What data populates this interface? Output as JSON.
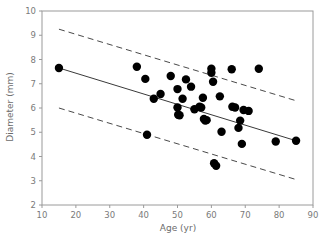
{
  "chart_data": {
    "type": "scatter",
    "title": "",
    "xlabel": "Age (yr)",
    "ylabel": "Diameter (mm)",
    "xlim": [
      10,
      90
    ],
    "ylim": [
      2,
      10
    ],
    "xticks": [
      10,
      20,
      30,
      40,
      50,
      60,
      70,
      80,
      90
    ],
    "yticks": [
      2,
      3,
      4,
      5,
      6,
      7,
      8,
      9,
      10
    ],
    "xtick_labels": [
      "10",
      "20",
      "30",
      "40",
      "50",
      "60",
      "70",
      "80",
      "90"
    ],
    "ytick_labels": [
      "2",
      "3",
      "4",
      "5",
      "6",
      "7",
      "8",
      "9",
      "10"
    ],
    "grid": false,
    "legend": "none",
    "marker": {
      "shape": "circle",
      "color": "#000000",
      "size": 4.2
    },
    "points": [
      {
        "x": 15.0,
        "y": 7.65
      },
      {
        "x": 38.0,
        "y": 7.7
      },
      {
        "x": 40.5,
        "y": 7.2
      },
      {
        "x": 41.0,
        "y": 4.9
      },
      {
        "x": 43.0,
        "y": 6.38
      },
      {
        "x": 45.0,
        "y": 6.58
      },
      {
        "x": 48.0,
        "y": 7.32
      },
      {
        "x": 50.0,
        "y": 6.78
      },
      {
        "x": 50.0,
        "y": 6.02
      },
      {
        "x": 50.2,
        "y": 5.72
      },
      {
        "x": 50.6,
        "y": 5.7
      },
      {
        "x": 51.5,
        "y": 6.38
      },
      {
        "x": 52.5,
        "y": 7.18
      },
      {
        "x": 54.0,
        "y": 6.88
      },
      {
        "x": 55.0,
        "y": 5.95
      },
      {
        "x": 56.5,
        "y": 6.05
      },
      {
        "x": 57.0,
        "y": 6.02
      },
      {
        "x": 57.5,
        "y": 6.42
      },
      {
        "x": 57.8,
        "y": 5.55
      },
      {
        "x": 58.2,
        "y": 5.48
      },
      {
        "x": 58.6,
        "y": 5.5
      },
      {
        "x": 60.0,
        "y": 7.62
      },
      {
        "x": 60.0,
        "y": 7.45
      },
      {
        "x": 60.5,
        "y": 7.08
      },
      {
        "x": 60.8,
        "y": 3.72
      },
      {
        "x": 61.4,
        "y": 3.62
      },
      {
        "x": 62.5,
        "y": 6.48
      },
      {
        "x": 63.0,
        "y": 5.02
      },
      {
        "x": 66.0,
        "y": 7.6
      },
      {
        "x": 66.2,
        "y": 6.05
      },
      {
        "x": 67.0,
        "y": 6.02
      },
      {
        "x": 68.0,
        "y": 5.18
      },
      {
        "x": 68.5,
        "y": 5.48
      },
      {
        "x": 69.0,
        "y": 4.52
      },
      {
        "x": 69.5,
        "y": 5.92
      },
      {
        "x": 71.0,
        "y": 5.88
      },
      {
        "x": 74.0,
        "y": 7.62
      },
      {
        "x": 79.0,
        "y": 4.62
      },
      {
        "x": 85.0,
        "y": 4.65
      }
    ],
    "fit_line": {
      "name": "regression-line",
      "style": "solid",
      "color": "#3a3a3a",
      "x": [
        15,
        85
      ],
      "y": [
        7.65,
        4.65
      ]
    },
    "bands": [
      {
        "name": "upper-prediction-band",
        "style": "dashed",
        "color": "#4a4a4a",
        "x": [
          15,
          85
        ],
        "y": [
          9.25,
          6.3
        ]
      },
      {
        "name": "lower-prediction-band",
        "style": "dashed",
        "color": "#4a4a4a",
        "x": [
          15,
          85
        ],
        "y": [
          6.0,
          3.05
        ]
      }
    ]
  }
}
